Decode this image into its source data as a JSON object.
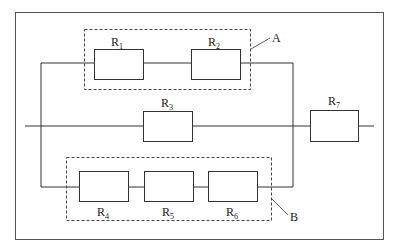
{
  "diagram": {
    "type": "circuit",
    "resistors": [
      {
        "id": "R1",
        "letter": "R",
        "sub": "1"
      },
      {
        "id": "R2",
        "letter": "R",
        "sub": "2"
      },
      {
        "id": "R3",
        "letter": "R",
        "sub": "3"
      },
      {
        "id": "R4",
        "letter": "R",
        "sub": "4"
      },
      {
        "id": "R5",
        "letter": "R",
        "sub": "5"
      },
      {
        "id": "R6",
        "letter": "R",
        "sub": "6"
      },
      {
        "id": "R7",
        "letter": "R",
        "sub": "7"
      }
    ],
    "groups": [
      {
        "id": "A",
        "label": "A",
        "members": [
          "R1",
          "R2"
        ]
      },
      {
        "id": "B",
        "label": "B",
        "members": [
          "R4",
          "R5",
          "R6"
        ]
      }
    ],
    "colors": {
      "line": "#333333",
      "background": "#ffffff"
    }
  }
}
